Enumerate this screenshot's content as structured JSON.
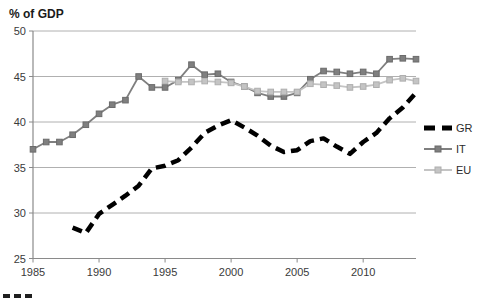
{
  "chart_data": {
    "type": "line",
    "ylabel": "% of GDP",
    "xlabel": "",
    "xlim": [
      1985,
      2014
    ],
    "ylim": [
      25,
      50
    ],
    "xticks": [
      1985,
      1990,
      1995,
      2000,
      2005,
      2010
    ],
    "yticks": [
      25,
      30,
      35,
      40,
      45,
      50
    ],
    "grid": "horizontal",
    "legend_position": "right-outside",
    "series": [
      {
        "name": "GR",
        "color": "#000000",
        "style": "dashed-thick",
        "marker": "none",
        "x": [
          1988,
          1989,
          1990,
          1991,
          1992,
          1993,
          1994,
          1995,
          1996,
          1997,
          1998,
          1999,
          2000,
          2001,
          2002,
          2003,
          2004,
          2005,
          2006,
          2007,
          2008,
          2009,
          2010,
          2011,
          2012,
          2013,
          2014
        ],
        "values": [
          28.4,
          27.8,
          29.9,
          30.9,
          31.9,
          33.0,
          34.9,
          35.2,
          35.8,
          37.2,
          38.8,
          39.6,
          40.2,
          39.4,
          38.5,
          37.4,
          36.7,
          36.9,
          37.9,
          38.2,
          37.3,
          36.5,
          37.8,
          38.8,
          40.4,
          41.6,
          43.2
        ]
      },
      {
        "name": "IT",
        "color": "#7f7f7f",
        "marker_edge": "#6b6b6b",
        "style": "solid",
        "marker": "square",
        "x": [
          1985,
          1986,
          1987,
          1988,
          1989,
          1990,
          1991,
          1992,
          1993,
          1994,
          1995,
          1996,
          1997,
          1998,
          1999,
          2000,
          2001,
          2002,
          2003,
          2004,
          2005,
          2006,
          2007,
          2008,
          2009,
          2010,
          2011,
          2012,
          2013,
          2014
        ],
        "values": [
          37.0,
          37.8,
          37.8,
          38.6,
          39.7,
          40.9,
          41.9,
          42.4,
          45.0,
          43.8,
          43.8,
          44.6,
          46.3,
          45.2,
          45.3,
          44.4,
          43.9,
          43.2,
          42.8,
          42.8,
          43.2,
          44.7,
          45.6,
          45.5,
          45.3,
          45.5,
          45.3,
          46.9,
          47.0,
          46.9
        ]
      },
      {
        "name": "EU",
        "color": "#c4c4c4",
        "marker_edge": "#aeaeae",
        "style": "solid",
        "marker": "square",
        "x": [
          1995,
          1996,
          1997,
          1998,
          1999,
          2000,
          2001,
          2002,
          2003,
          2004,
          2005,
          2006,
          2007,
          2008,
          2009,
          2010,
          2011,
          2012,
          2013,
          2014
        ],
        "values": [
          44.5,
          44.4,
          44.4,
          44.5,
          44.4,
          44.3,
          43.9,
          43.4,
          43.3,
          43.3,
          43.3,
          44.2,
          44.1,
          44.0,
          43.8,
          43.9,
          44.1,
          44.6,
          44.8,
          44.5
        ]
      }
    ],
    "legend": {
      "items": [
        "GR",
        "IT",
        "EU"
      ]
    }
  }
}
